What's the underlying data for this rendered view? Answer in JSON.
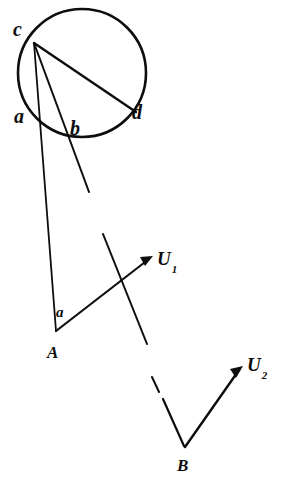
{
  "figure": {
    "background_color": "#ffffff",
    "ink_color": "#0d0d0d",
    "canvas": {
      "width": 282,
      "height": 499
    }
  },
  "labels": {
    "c": "c",
    "a_circle": "a",
    "b_circle": "b",
    "d_circle": "d",
    "angle_a": "a",
    "point_A": "A",
    "point_B": "B",
    "vector_U1_base": "U",
    "vector_U1_sub": "1",
    "vector_U2_base": "U",
    "vector_U2_sub": "2"
  },
  "geometry": {
    "circle": {
      "cx": 82,
      "cy": 73,
      "r": 64
    },
    "points": {
      "c": {
        "x": 34,
        "y": 41
      },
      "a": {
        "x": 36,
        "y": 114
      },
      "b": {
        "x": 74,
        "y": 131
      },
      "d": {
        "x": 133,
        "y": 112
      },
      "A": {
        "x": 56,
        "y": 331
      },
      "B": {
        "x": 185,
        "y": 447
      },
      "U1_tip": {
        "x": 153,
        "y": 256
      },
      "U2_tip": {
        "x": 243,
        "y": 366
      }
    },
    "chords": [
      {
        "name": "chord-c-a",
        "from": "c",
        "to": "a"
      },
      {
        "name": "chord-c-b",
        "from": "c",
        "to": "b"
      },
      {
        "name": "chord-c-d",
        "from": "c",
        "to": "d"
      }
    ],
    "rays": [
      {
        "name": "ray-c-a-A",
        "from": "c",
        "through": "a",
        "to": "A"
      },
      {
        "name": "ray-c-b-extended",
        "from": "c",
        "through": "b",
        "to": {
          "x": 88,
          "y": 190
        }
      },
      {
        "name": "vector-A-U1",
        "from": "A",
        "to": "U1_tip",
        "arrow": true
      },
      {
        "name": "vector-B-U2",
        "from": "B",
        "to": "U2_tip",
        "arrow": true
      },
      {
        "name": "transversal-upper",
        "from": {
          "x": 103,
          "y": 234
        },
        "to": {
          "x": 147,
          "y": 344
        }
      },
      {
        "name": "transversal-lower-dash-1",
        "from": {
          "x": 153,
          "y": 378
        },
        "to": {
          "x": 159,
          "y": 392
        }
      },
      {
        "name": "transversal-lower-dash-2",
        "from": {
          "x": 163,
          "y": 399
        },
        "to": {
          "x": 185,
          "y": 447
        }
      }
    ]
  }
}
